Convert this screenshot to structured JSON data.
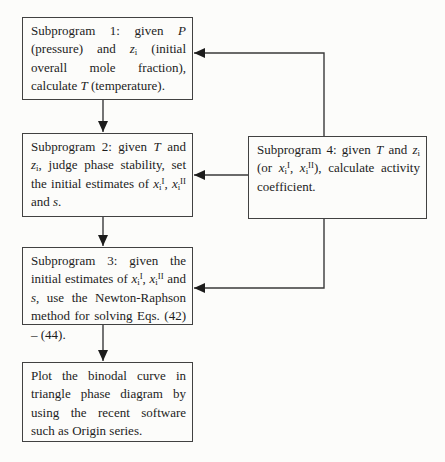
{
  "diagram": {
    "type": "flowchart",
    "colors": {
      "background": "#fcfcfa",
      "box_border": "#414141",
      "connector_line": "#3a3a3a",
      "arrowhead_fill": "#1c1c1c",
      "text": "#1d1d1d"
    },
    "boxes": {
      "subprogram1": {
        "plain_text": "Subprogram 1: given P (pressure) and zi (initial overall mole fraction), calculate T (temperature).",
        "segments": [
          {
            "t": "Subprogram 1: given "
          },
          {
            "t": "P",
            "i": true
          },
          {
            "t": " (pressure) and "
          },
          {
            "t": "z",
            "i": true
          },
          {
            "t": "i",
            "sub": true
          },
          {
            "t": " (initial overall mole fraction), calculate "
          },
          {
            "t": "T",
            "i": true
          },
          {
            "t": " (temperature)."
          }
        ]
      },
      "subprogram2": {
        "plain_text": "Subprogram 2: given T and zi, judge phase stability, set the initial estimates of xiI, xiII and s.",
        "segments": [
          {
            "t": "Subprogram 2: given "
          },
          {
            "t": "T",
            "i": true
          },
          {
            "t": " and "
          },
          {
            "t": "z",
            "i": true
          },
          {
            "t": "i",
            "sub": true
          },
          {
            "t": ", judge phase stability, set the initial estimates of "
          },
          {
            "t": "x",
            "i": true
          },
          {
            "t": "i",
            "sub": true
          },
          {
            "t": "I",
            "sup": true
          },
          {
            "t": ", "
          },
          {
            "t": "x",
            "i": true
          },
          {
            "t": "i",
            "sub": true
          },
          {
            "t": "II",
            "sup": true
          },
          {
            "t": " and "
          },
          {
            "t": "s",
            "i": true
          },
          {
            "t": "."
          }
        ]
      },
      "subprogram3": {
        "plain_text": "Subprogram 3: given the initial estimates of xiI, xiII and s, use the Newton-Raphson method for solving Eqs. (42) – (44).",
        "segments": [
          {
            "t": "Subprogram 3: given the initial estimates of "
          },
          {
            "t": "x",
            "i": true
          },
          {
            "t": "i",
            "sub": true
          },
          {
            "t": "I",
            "sup": true
          },
          {
            "t": ", "
          },
          {
            "t": "x",
            "i": true
          },
          {
            "t": "i",
            "sub": true
          },
          {
            "t": "II",
            "sup": true
          },
          {
            "t": " and "
          },
          {
            "t": "s",
            "i": true
          },
          {
            "t": ", use the Newton-Raphson method for solving Eqs. (42) – (44)."
          }
        ]
      },
      "subprogram4": {
        "plain_text": "Subprogram 4: given T and zi (or xiI, xiII), calculate activity coefficient.",
        "segments": [
          {
            "t": "Subprogram 4: given "
          },
          {
            "t": "T",
            "i": true
          },
          {
            "t": " and "
          },
          {
            "t": "z",
            "i": true
          },
          {
            "t": "i",
            "sub": true
          },
          {
            "t": " (or "
          },
          {
            "t": "x",
            "i": true
          },
          {
            "t": "i",
            "sub": true
          },
          {
            "t": "I",
            "sup": true
          },
          {
            "t": ", "
          },
          {
            "t": "x",
            "i": true
          },
          {
            "t": "i",
            "sub": true
          },
          {
            "t": "II",
            "sup": true
          },
          {
            "t": "), calculate activity coefficient."
          }
        ]
      },
      "plot": {
        "plain_text": "Plot the binodal curve in triangle phase diagram by using the recent software such as Origin series.",
        "segments": [
          {
            "t": "Plot the binodal curve in triangle phase diagram by using the recent software such as Origin series."
          }
        ]
      }
    },
    "connections": [
      {
        "from": "subprogram1",
        "to": "subprogram2"
      },
      {
        "from": "subprogram2",
        "to": "subprogram3"
      },
      {
        "from": "subprogram3",
        "to": "plot"
      },
      {
        "from": "subprogram4",
        "to": "subprogram1"
      },
      {
        "from": "subprogram4",
        "to": "subprogram2"
      },
      {
        "from": "subprogram4",
        "to": "subprogram3"
      }
    ]
  }
}
